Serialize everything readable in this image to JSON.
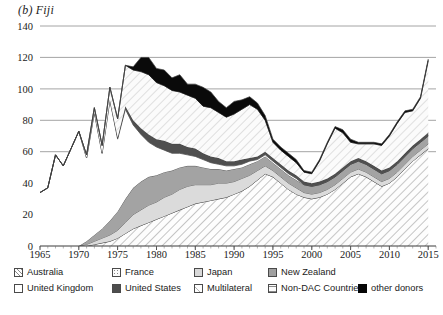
{
  "chart_title": "(b) Fiji",
  "axes": {
    "y_ticks": [
      "0",
      "20",
      "40",
      "60",
      "80",
      "100",
      "120",
      "140"
    ],
    "y_min": 0,
    "y_max": 140,
    "x_ticks": [
      "1965",
      "1970",
      "1975",
      "1980",
      "1985",
      "1990",
      "1995",
      "2000",
      "2005",
      "2010",
      "2015"
    ],
    "x_min": 1965,
    "x_max": 2016
  },
  "legend": {
    "row1": [
      {
        "key": "australia",
        "label": "Australia",
        "icon": "swatch-hatch-diagonal",
        "color": "#fdfdfd"
      },
      {
        "key": "france",
        "label": "France",
        "icon": "swatch-dotted",
        "color": "#fbfbfb"
      },
      {
        "key": "japan",
        "label": "Japan",
        "icon": "swatch-solid",
        "color": "#d8d8d8"
      },
      {
        "key": "new_zealand",
        "label": "New Zealand",
        "icon": "swatch-solid",
        "color": "#a0a0a0"
      }
    ],
    "row2": [
      {
        "key": "united_kingdom",
        "label": "United Kingdom",
        "icon": "swatch-solid",
        "color": "#ffffff"
      },
      {
        "key": "united_states",
        "label": "United States",
        "icon": "swatch-solid",
        "color": "#4d4d4d"
      },
      {
        "key": "multilateral",
        "label": "Multilateral",
        "icon": "swatch-hatch-light",
        "color": "#fdfdfd"
      },
      {
        "key": "non_dac",
        "label": "Non-DAC Countries",
        "icon": "swatch-hatch-horizontal",
        "color": "#fcfcfc"
      },
      {
        "key": "other_donors",
        "label": "other donors",
        "icon": "swatch-solid",
        "color": "#060606"
      }
    ]
  },
  "chart_data": {
    "type": "area",
    "stacked": true,
    "title": "(b) Fiji",
    "xlabel": "",
    "ylabel": "",
    "ylim": [
      0,
      140
    ],
    "xlim": [
      1965,
      2016
    ],
    "grid": "horizontal",
    "legend_position": "bottom",
    "x": [
      1965,
      1966,
      1967,
      1968,
      1969,
      1970,
      1971,
      1972,
      1973,
      1974,
      1975,
      1976,
      1977,
      1978,
      1979,
      1980,
      1981,
      1982,
      1983,
      1984,
      1985,
      1986,
      1987,
      1988,
      1989,
      1990,
      1991,
      1992,
      1993,
      1994,
      1995,
      1996,
      1997,
      1998,
      1999,
      2000,
      2001,
      2002,
      2003,
      2004,
      2005,
      2006,
      2007,
      2008,
      2009,
      2010,
      2011,
      2012,
      2013,
      2014,
      2015
    ],
    "series": [
      {
        "name": "Australia",
        "pattern": "diagonal-hatch",
        "values": [
          0,
          0,
          0,
          0,
          0,
          0,
          0,
          1,
          2,
          3,
          5,
          8,
          11,
          13,
          15,
          17,
          19,
          21,
          23,
          25,
          27,
          28,
          29,
          30,
          31,
          33,
          35,
          38,
          42,
          46,
          44,
          40,
          36,
          33,
          31,
          30,
          31,
          33,
          36,
          40,
          44,
          46,
          44,
          41,
          38,
          40,
          44,
          49,
          54,
          58,
          62
        ]
      },
      {
        "name": "France",
        "pattern": "dotted",
        "values": [
          0,
          0,
          0,
          0,
          0,
          0,
          0,
          0,
          0,
          0,
          0,
          0,
          0,
          0,
          0,
          0,
          0,
          0,
          0,
          0,
          0,
          0,
          0,
          0,
          0,
          0,
          0,
          0,
          0,
          0,
          0,
          0,
          0,
          0,
          0,
          0,
          0,
          0,
          0,
          0,
          0,
          0,
          0,
          0,
          0,
          0,
          0,
          0,
          0,
          0,
          0
        ]
      },
      {
        "name": "Japan",
        "pattern": "solid-light",
        "values": [
          0,
          0,
          0,
          0,
          0,
          0,
          1,
          2,
          3,
          4,
          5,
          7,
          9,
          10,
          11,
          11,
          12,
          12,
          13,
          13,
          12,
          11,
          10,
          10,
          9,
          8,
          8,
          7,
          6,
          5,
          4,
          4,
          4,
          4,
          3,
          3,
          3,
          3,
          3,
          3,
          3,
          3,
          3,
          3,
          3,
          3,
          3,
          3,
          3,
          3,
          3
        ]
      },
      {
        "name": "New Zealand",
        "pattern": "solid-mid",
        "values": [
          0,
          0,
          0,
          0,
          0,
          0,
          2,
          4,
          6,
          9,
          12,
          15,
          17,
          18,
          18,
          17,
          16,
          15,
          14,
          13,
          12,
          11,
          10,
          9,
          8,
          8,
          7,
          7,
          6,
          6,
          5,
          5,
          5,
          5,
          5,
          5,
          5,
          5,
          5,
          5,
          5,
          5,
          5,
          5,
          5,
          5,
          5,
          5,
          5,
          5,
          5
        ]
      },
      {
        "name": "United Kingdom",
        "pattern": "white",
        "values": [
          34,
          37,
          58,
          51,
          62,
          73,
          53,
          78,
          48,
          77,
          46,
          57,
          40,
          30,
          22,
          18,
          14,
          11,
          9,
          7,
          6,
          5,
          4,
          3,
          3,
          2,
          2,
          2,
          1,
          1,
          1,
          1,
          1,
          1,
          0,
          0,
          0,
          0,
          0,
          0,
          0,
          0,
          0,
          0,
          0,
          0,
          0,
          0,
          0,
          0,
          0
        ]
      },
      {
        "name": "United States",
        "pattern": "dark",
        "values": [
          0,
          0,
          0,
          0,
          0,
          0,
          0,
          0,
          0,
          0,
          1,
          2,
          3,
          4,
          5,
          5,
          6,
          6,
          6,
          5,
          5,
          4,
          4,
          4,
          3,
          3,
          3,
          2,
          2,
          2,
          2,
          2,
          2,
          2,
          2,
          2,
          2,
          2,
          2,
          2,
          2,
          2,
          2,
          2,
          2,
          2,
          2,
          2,
          2,
          2,
          2
        ]
      },
      {
        "name": "Multilateral",
        "pattern": "light-hatch",
        "values": [
          0,
          0,
          0,
          0,
          0,
          0,
          2,
          3,
          5,
          8,
          12,
          26,
          32,
          36,
          38,
          36,
          35,
          34,
          33,
          33,
          32,
          30,
          31,
          29,
          28,
          30,
          32,
          34,
          30,
          20,
          10,
          9,
          9,
          8,
          6,
          6,
          13,
          22,
          29,
          22,
          12,
          9,
          11,
          14,
          16,
          20,
          24,
          26,
          22,
          26,
          46
        ]
      },
      {
        "name": "Non-DAC Countries",
        "pattern": "horizontal-hatch",
        "values": [
          0,
          0,
          0,
          0,
          0,
          0,
          0,
          0,
          0,
          0,
          0,
          0,
          0,
          0,
          0,
          0,
          0,
          0,
          0,
          0,
          0,
          0,
          0,
          0,
          0,
          0,
          0,
          0,
          0,
          0,
          0,
          0,
          0,
          0,
          0,
          0,
          0,
          0,
          0,
          0,
          0,
          0,
          0,
          0,
          0,
          0,
          0,
          0,
          0,
          0,
          0
        ]
      },
      {
        "name": "other donors",
        "pattern": "black",
        "values": [
          0,
          0,
          0,
          0,
          0,
          0,
          0,
          0,
          0,
          0,
          0,
          0,
          2,
          9,
          11,
          9,
          10,
          8,
          11,
          7,
          9,
          12,
          10,
          7,
          6,
          8,
          6,
          5,
          4,
          3,
          2,
          2,
          2,
          2,
          1,
          1,
          1,
          1,
          1,
          2,
          2,
          1,
          1,
          1,
          1,
          1,
          1,
          1,
          1,
          1,
          1
        ]
      }
    ],
    "notable_points": [
      {
        "year": 1976,
        "total": 120,
        "note": "peak"
      },
      {
        "year": 1970,
        "total": 73
      },
      {
        "year": 1986,
        "total": 109
      },
      {
        "year": 1992,
        "total": 111
      },
      {
        "year": 2015,
        "total": 118
      }
    ]
  }
}
